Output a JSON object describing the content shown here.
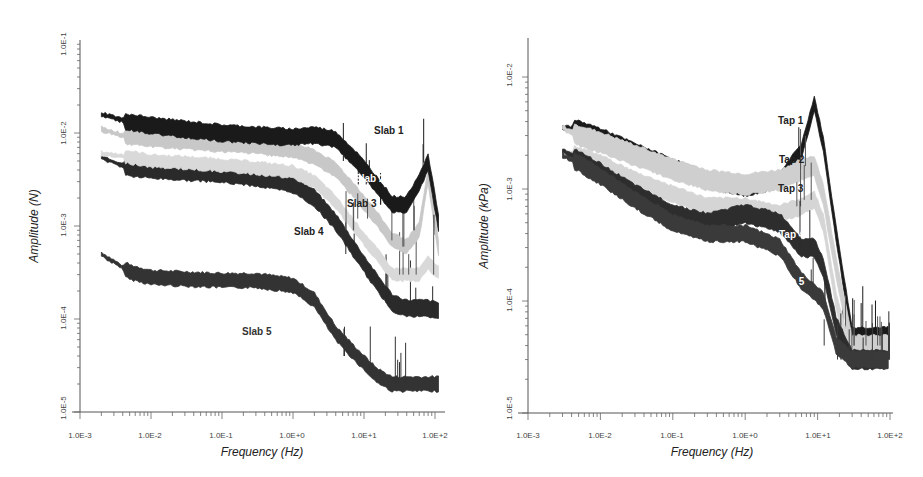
{
  "chart_data": [
    {
      "type": "line",
      "title": "",
      "xlabel": "Frequency (Hz)",
      "ylabel": "Amplitude (N)",
      "xscale": "log",
      "yscale": "log",
      "xlim": [
        0.001,
        100
      ],
      "ylim": [
        1e-05,
        0.1
      ],
      "grid": false,
      "legend": "inline labels",
      "x_ticks": [
        "1.0E-3",
        "1.0E-2",
        "1.0E-1",
        "1.0E+0",
        "1.0E+1",
        "1.0E+2"
      ],
      "y_ticks": [
        "1.0E-5",
        "1.0E-4",
        "1.0E-3",
        "1.0E-2",
        "1.0E-1"
      ],
      "x": [
        0.002,
        0.005,
        0.01,
        0.03,
        0.1,
        0.3,
        1,
        2,
        4,
        8,
        15,
        25,
        40,
        60,
        80,
        120
      ],
      "series": [
        {
          "name": "Slab 1",
          "color": "#1a1a1a",
          "values": [
            0.016,
            0.013,
            0.012,
            0.011,
            0.01,
            0.0095,
            0.009,
            0.0095,
            0.0085,
            0.005,
            0.0028,
            0.0017,
            0.0017,
            0.003,
            0.0048,
            0.0008
          ]
        },
        {
          "name": "Slab 2",
          "color": "#c8c8c8",
          "values": [
            0.011,
            0.009,
            0.0085,
            0.008,
            0.0075,
            0.0072,
            0.0065,
            0.0055,
            0.004,
            0.0022,
            0.0012,
            0.0007,
            0.0006,
            0.0009,
            0.0035,
            0.0004
          ]
        },
        {
          "name": "Slab 3",
          "color": "#d9d9d9",
          "values": [
            0.006,
            0.0055,
            0.005,
            0.0048,
            0.0045,
            0.0042,
            0.0038,
            0.003,
            0.0018,
            0.0009,
            0.0005,
            0.0003,
            0.0003,
            0.0003,
            0.0004,
            0.0003
          ]
        },
        {
          "name": "Slab 4",
          "color": "#2a2a2a",
          "values": [
            0.0055,
            0.0042,
            0.004,
            0.0038,
            0.0036,
            0.0033,
            0.0028,
            0.002,
            0.0011,
            0.0005,
            0.00025,
            0.00015,
            0.00013,
            0.00013,
            0.00013,
            0.00012
          ]
        },
        {
          "name": "Slab 5",
          "color": "#333333",
          "values": [
            0.0005,
            0.00032,
            0.00028,
            0.00027,
            0.00026,
            0.00026,
            0.00023,
            0.00016,
            7e-05,
            4e-05,
            2.5e-05,
            2e-05,
            2e-05,
            2e-05,
            2e-05,
            2e-05
          ]
        }
      ]
    },
    {
      "type": "line",
      "title": "",
      "xlabel": "Frequency (Hz)",
      "ylabel": "Amplitude (kPa)",
      "xscale": "log",
      "yscale": "log",
      "xlim": [
        0.001,
        100
      ],
      "ylim": [
        1e-05,
        0.02
      ],
      "grid": false,
      "legend": "inline labels",
      "x_ticks": [
        "1.0E-3",
        "1.0E-2",
        "1.0E-1",
        "1.0E+0",
        "1.0E+1",
        "1.0E+2"
      ],
      "y_ticks": [
        "1.0E-5",
        "1.0E-4",
        "1.0E-3",
        "1.0E-2"
      ],
      "x": [
        0.003,
        0.005,
        0.01,
        0.03,
        0.1,
        0.3,
        1,
        3,
        6,
        9,
        12,
        18,
        30,
        60,
        100
      ],
      "series": [
        {
          "name": "Tap 1",
          "color": "#1a1a1a",
          "values": [
            0.0035,
            0.0035,
            0.003,
            0.0022,
            0.0016,
            0.0012,
            0.001,
            0.0012,
            0.0022,
            0.0058,
            0.0025,
            0.0004,
            5e-05,
            5e-05,
            5e-05
          ]
        },
        {
          "name": "Tap 2",
          "color": "#cfcfcf",
          "values": [
            0.0035,
            0.003,
            0.0026,
            0.002,
            0.0015,
            0.0012,
            0.0011,
            0.0012,
            0.0015,
            0.0016,
            0.0009,
            0.0002,
            4e-05,
            4e-05,
            4e-05
          ]
        },
        {
          "name": "Tap 3",
          "color": "#d5d5d5",
          "values": [
            0.0022,
            0.002,
            0.0017,
            0.0012,
            0.0009,
            0.0007,
            0.0007,
            0.0006,
            0.0007,
            0.0008,
            0.0005,
            0.0001,
            3e-05,
            3e-05,
            3e-05
          ]
        },
        {
          "name": "Tap 4",
          "color": "#2d2d2d",
          "values": [
            0.0022,
            0.0018,
            0.0014,
            0.0009,
            0.0006,
            0.0005,
            0.0006,
            0.0005,
            0.0003,
            0.0003,
            0.0002,
            6e-05,
            3e-05,
            3e-05,
            3e-05
          ]
        },
        {
          "name": "Tap 5",
          "color": "#3a3a3a",
          "values": [
            0.002,
            0.0017,
            0.0013,
            0.0008,
            0.0005,
            0.0004,
            0.0004,
            0.0003,
            0.00015,
            0.00012,
            0.0001,
            4e-05,
            3e-05,
            3e-05,
            3e-05
          ]
        }
      ]
    }
  ],
  "left_chart": {
    "ylabel": "Amplitude (N)",
    "xlabel": "Frequency (Hz)",
    "y_ticks": [
      "1.0E-1",
      "1.0E-2",
      "1.0E-3",
      "1.0E-4",
      "1.0E-5"
    ],
    "x_ticks": [
      "1.0E-3",
      "1.0E-2",
      "1.0E-1",
      "1.0E+0",
      "1.0E+1",
      "1.0E+2"
    ],
    "labels": [
      "Slab 1",
      "Slab 2",
      "Slab 3",
      "Slab 4",
      "Slab 5"
    ]
  },
  "right_chart": {
    "ylabel": "Amplitude (kPa)",
    "xlabel": "Frequency (Hz)",
    "y_ticks": [
      "1.0E-2",
      "1.0E-3",
      "1.0E-4",
      "1.0E-5"
    ],
    "x_ticks": [
      "1.0E-3",
      "1.0E-2",
      "1.0E-1",
      "1.0E+0",
      "1.0E+1",
      "1.0E+2"
    ],
    "labels": [
      "Tap 1",
      "Tap 2",
      "Tap 3",
      "Tap 4",
      "Tap 5"
    ]
  }
}
